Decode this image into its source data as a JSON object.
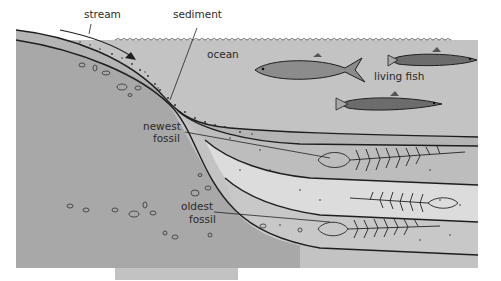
{
  "diagram": {
    "type": "cross-section illustration",
    "labels": {
      "stream": "stream",
      "sediment": "sediment",
      "ocean": "ocean",
      "living_fish": "living fish",
      "newest_fossil_line1": "newest",
      "newest_fossil_line2": "fossil",
      "oldest_fossil_line1": "oldest",
      "oldest_fossil_line2": "fossil"
    },
    "colors": {
      "land": "#a9a9a9",
      "ocean": "#c4c4c4",
      "sediment_layer_dark": "#b6b6b6",
      "sediment_layer_light": "#dadada",
      "outline": "#1e1e1e",
      "background": "#ffffff"
    }
  }
}
